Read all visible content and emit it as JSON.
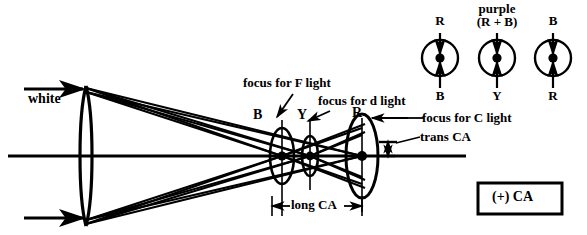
{
  "diagram": {
    "axis_label": "optical axis",
    "input_label": "white",
    "focus_labels": [
      {
        "id": "focus-f",
        "text": "focus for F light"
      },
      {
        "id": "focus-d",
        "text": "focus for d light"
      },
      {
        "id": "focus-c",
        "text": "focus for C light"
      }
    ],
    "focus_points": [
      {
        "id": "point-b",
        "text": "B"
      },
      {
        "id": "point-y",
        "text": "Y"
      },
      {
        "id": "point-r",
        "text": "R"
      }
    ],
    "measurements": [
      {
        "id": "long-ca",
        "text": "long CA"
      },
      {
        "id": "trans-ca",
        "text": "trans CA"
      }
    ],
    "sign_box": {
      "text": "(+) CA"
    }
  },
  "spot_diagrams": [
    {
      "id": "spot-1",
      "top_label": "R",
      "top_label_line2": "",
      "bottom_label": "B"
    },
    {
      "id": "spot-2",
      "top_label": "purple",
      "top_label_line2": "(R + B)",
      "bottom_label": "Y"
    },
    {
      "id": "spot-3",
      "top_label": "B",
      "top_label_line2": "",
      "bottom_label": "R"
    }
  ],
  "colors": {
    "ink": "#000000",
    "paper": "#ffffff"
  }
}
